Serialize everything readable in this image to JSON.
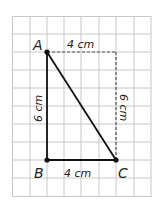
{
  "diagram": {
    "type": "geometry-grid",
    "grid": {
      "cols": 8,
      "rows": 10,
      "color": "#c8c8c8"
    },
    "points": [
      {
        "name": "A",
        "label": "A"
      },
      {
        "name": "B",
        "label": "B"
      },
      {
        "name": "C",
        "label": "C"
      }
    ],
    "segments": [
      {
        "from": "A",
        "to": "B",
        "style": "solid",
        "label": "6 cm"
      },
      {
        "from": "B",
        "to": "C",
        "style": "solid",
        "label": "4 cm"
      },
      {
        "from": "A",
        "to": "C",
        "style": "solid",
        "label": ""
      },
      {
        "from": "A",
        "to": "D",
        "style": "dashed",
        "label": "4 cm"
      },
      {
        "from": "D",
        "to": "C",
        "style": "dashed",
        "label": "6 cm"
      }
    ],
    "labels": {
      "A": "A",
      "B": "B",
      "C": "C",
      "top": "4 cm",
      "bottom": "4 cm",
      "left": "6 cm",
      "right": "6 cm"
    },
    "colors": {
      "line": "#111111",
      "grid": "#c8c8c8"
    }
  }
}
